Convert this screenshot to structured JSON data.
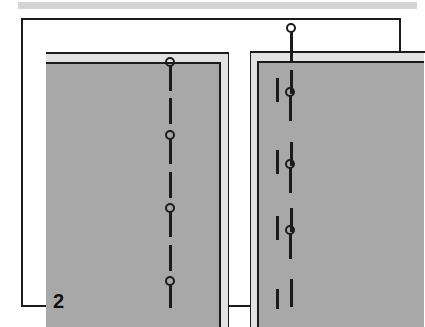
{
  "figure": {
    "number_label": "2",
    "caption": "",
    "colors": {
      "fabric_gray": "#a8a8a8",
      "fold_highlight_gray": "#e2e2e2",
      "ink_black": "#1b1b1b",
      "scan_bar_gray": "#d4d4d4",
      "background_white": "#ffffff"
    }
  },
  "scan_bar": {
    "present": true
  },
  "panels": [
    {
      "id": "left-panel",
      "name": "left fabric panel",
      "fold_edge": "right",
      "marks": [
        {
          "type": "pin",
          "x": 163,
          "y": 55,
          "shaft_length": 26
        },
        {
          "type": "dash",
          "x": 167,
          "y": 96,
          "length": 26
        },
        {
          "type": "pin",
          "x": 163,
          "y": 128,
          "shaft_length": 26
        },
        {
          "type": "dash",
          "x": 167,
          "y": 170,
          "length": 26
        },
        {
          "type": "pin",
          "x": 163,
          "y": 201,
          "shaft_length": 26
        },
        {
          "type": "dash",
          "x": 167,
          "y": 243,
          "length": 26
        },
        {
          "type": "pin",
          "x": 163,
          "y": 274,
          "shaft_length": 24
        }
      ]
    },
    {
      "id": "right-panel",
      "name": "right fabric panel",
      "fold_edge": "left",
      "marks": [
        {
          "type": "pin",
          "x": 284,
          "y": 21,
          "shaft_length": 30
        },
        {
          "type": "dash",
          "x": 288,
          "y": 68,
          "length": 24
        },
        {
          "type": "dash",
          "x": 274,
          "y": 76,
          "length": 24
        },
        {
          "type": "pin",
          "x": 283,
          "y": 85,
          "shaft_length": 26
        },
        {
          "type": "dash",
          "x": 288,
          "y": 140,
          "length": 24
        },
        {
          "type": "dash",
          "x": 274,
          "y": 148,
          "length": 24
        },
        {
          "type": "pin",
          "x": 283,
          "y": 157,
          "shaft_length": 26
        },
        {
          "type": "dash",
          "x": 288,
          "y": 206,
          "length": 24
        },
        {
          "type": "dash",
          "x": 274,
          "y": 214,
          "length": 24
        },
        {
          "type": "pin",
          "x": 283,
          "y": 223,
          "shaft_length": 26
        },
        {
          "type": "dash",
          "x": 288,
          "y": 277,
          "length": 28
        },
        {
          "type": "dash",
          "x": 274,
          "y": 287,
          "length": 20
        }
      ]
    }
  ]
}
